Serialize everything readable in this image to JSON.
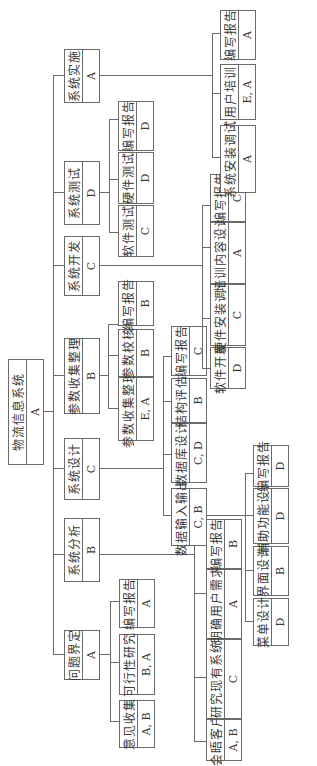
{
  "root": {
    "label": "物流信息系统",
    "role": "A"
  },
  "phases": [
    {
      "label": "问题界定",
      "role": "A"
    },
    {
      "label": "系统分析",
      "role": "B"
    },
    {
      "label": "系统设计",
      "role": "C"
    },
    {
      "label": "参数收集整理",
      "role": "B"
    },
    {
      "label": "系统开发",
      "role": "C"
    },
    {
      "label": "系统测试",
      "role": "D"
    },
    {
      "label": "系统实施",
      "role": "A"
    }
  ],
  "problem_def": [
    {
      "label": "意见收集",
      "role": "A, B"
    },
    {
      "label": "可行性研究",
      "role": "B, A"
    },
    {
      "label": "编写报告",
      "role": "A"
    }
  ],
  "analysis": [
    {
      "label": "会晤客户",
      "role": "A, B"
    },
    {
      "label": "研究现有系统",
      "role": "C"
    },
    {
      "label": "明确用户需求",
      "role": "A"
    },
    {
      "label": "编写报告",
      "role": "B"
    }
  ],
  "design": [
    {
      "label": "数据输入输出",
      "role": "C, B"
    },
    {
      "label": "数据库设计",
      "role": "C, D"
    },
    {
      "label": "结构评估",
      "role": "B"
    },
    {
      "label": "编写报告",
      "role": "C"
    }
  ],
  "io": [
    {
      "label": "菜单设计",
      "role": "D"
    },
    {
      "label": "界面设计",
      "role": "B"
    },
    {
      "label": "辅助功能设计",
      "role": "D"
    },
    {
      "label": "编写报告",
      "role": "D"
    }
  ],
  "params": [
    {
      "label": "参数收集整理",
      "role": "E, A"
    },
    {
      "label": "参数校核",
      "role": "B"
    },
    {
      "label": "编写报告",
      "role": "B"
    }
  ],
  "development": [
    {
      "label": "软件开发",
      "role": "D"
    },
    {
      "label": "硬件安装调试",
      "role": "C"
    },
    {
      "label": "培训内容设计",
      "role": "A"
    },
    {
      "label": "编写报告",
      "role": "C"
    }
  ],
  "testing": [
    {
      "label": "软件测试",
      "role": "C"
    },
    {
      "label": "硬件测试",
      "role": "D"
    },
    {
      "label": "编写报告",
      "role": "D"
    }
  ],
  "implementation": [
    {
      "label": "系统安装调试",
      "role": "A"
    },
    {
      "label": "用户培训",
      "role": "E, A"
    },
    {
      "label": "编写报告",
      "role": "A"
    }
  ]
}
